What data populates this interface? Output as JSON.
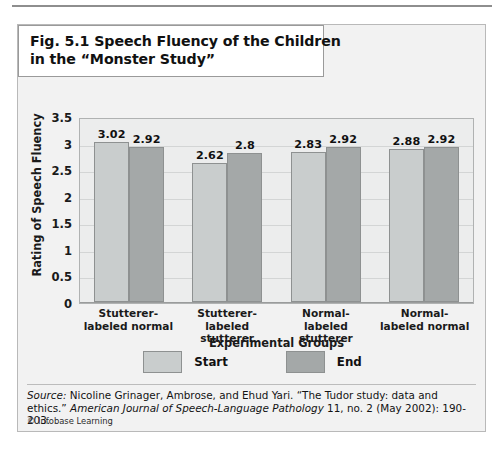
{
  "figure": {
    "title_line1": "Fig. 5.1 Speech Fluency of the Children",
    "title_line2": "in the “Monster Study”",
    "credit_mark": "©",
    "credit_text": "Infobase Learning",
    "source_label": "Source:",
    "source_text_1": " Nicoline Grinager, Ambrose, and Ehud Yari. “The Tudor study: data and ethics.” ",
    "source_italic_1": "American Journal of Speech-Language Pathology",
    "source_text_2": " 11, no. 2 (May 2002): 190-203."
  },
  "colors": {
    "start_bar": "#c9cdcd",
    "end_bar": "#a4a8a8",
    "panel_bg": "#f2f2f2",
    "plot_bg": "#eceded",
    "bar_border": "#8e9191"
  },
  "chart_data": {
    "type": "bar",
    "title": "Fig. 5.1 Speech Fluency of the Children in the “Monster Study”",
    "categories": [
      "Stutterer-labeled normal",
      "Stutterer-labeled stutterer",
      "Normal-labeled stutterer",
      "Normal-labeled normal"
    ],
    "category_lines": [
      [
        "Stutterer-",
        "labeled normal"
      ],
      [
        "Stutterer-",
        "labeled stutterer"
      ],
      [
        "Normal-",
        "labeled stutterer"
      ],
      [
        "Normal-",
        "labeled normal"
      ]
    ],
    "series": [
      {
        "name": "Start",
        "values": [
          3.02,
          2.92,
          2.83,
          2.88
        ],
        "labels": [
          "3.02",
          "2.62",
          "2.83",
          "2.88"
        ]
      },
      {
        "name": "End",
        "values": [
          2.92,
          2.8,
          2.92,
          2.92
        ],
        "labels": [
          "2.92",
          "2.8",
          "2.92",
          "2.92"
        ]
      }
    ],
    "values_by_group": [
      {
        "category": "Stutterer-labeled normal",
        "start": 3.02,
        "end": 2.92
      },
      {
        "category": "Stutterer-labeled stutterer",
        "start": 2.62,
        "end": 2.8
      },
      {
        "category": "Normal-labeled stutterer",
        "start": 2.83,
        "end": 2.92
      },
      {
        "category": "Normal-labeled normal",
        "start": 2.88,
        "end": 2.92
      }
    ],
    "xlabel": "Experimental Groups",
    "ylabel": "Rating of Speech Fluency",
    "ylim": [
      0,
      3.5
    ],
    "yticks": [
      "3.5",
      "3",
      "2.5",
      "2",
      "1.5",
      "1",
      "0.5",
      "0"
    ],
    "ytick_values": [
      3.5,
      3,
      2.5,
      2,
      1.5,
      1,
      0.5,
      0
    ],
    "grid": true,
    "legend": [
      "Start",
      "End"
    ],
    "legend_position": "bottom"
  }
}
